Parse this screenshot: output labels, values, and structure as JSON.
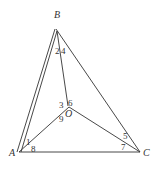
{
  "diagram": {
    "type": "geometry",
    "points": {
      "A": {
        "label": "A",
        "x": 19,
        "y": 152
      },
      "B": {
        "label": "B",
        "x": 56,
        "y": 29
      },
      "C": {
        "label": "C",
        "x": 140,
        "y": 152
      },
      "O": {
        "label": "O",
        "x": 69,
        "y": 107
      }
    },
    "segments": [
      {
        "from": "A",
        "to": "B",
        "style": "double"
      },
      {
        "from": "B",
        "to": "C",
        "style": "single"
      },
      {
        "from": "A",
        "to": "C",
        "style": "single"
      },
      {
        "from": "B",
        "to": "O",
        "style": "single"
      },
      {
        "from": "A",
        "to": "O",
        "style": "single"
      },
      {
        "from": "C",
        "to": "O",
        "style": "single"
      }
    ],
    "angle_labels": [
      {
        "text": "1",
        "x": 28,
        "y": 145
      },
      {
        "text": "2",
        "x": 55,
        "y": 54
      },
      {
        "text": "3",
        "x": 59,
        "y": 108
      },
      {
        "text": "4",
        "x": 62,
        "y": 54
      },
      {
        "text": "5",
        "x": 123,
        "y": 139
      },
      {
        "text": "6",
        "x": 68,
        "y": 106
      },
      {
        "text": "7",
        "x": 121,
        "y": 149
      },
      {
        "text": "8",
        "x": 31,
        "y": 152
      },
      {
        "text": "9",
        "x": 59,
        "y": 122
      }
    ],
    "vertex_labels": {
      "A": "A",
      "B": "B",
      "C": "C",
      "O": "O"
    }
  }
}
